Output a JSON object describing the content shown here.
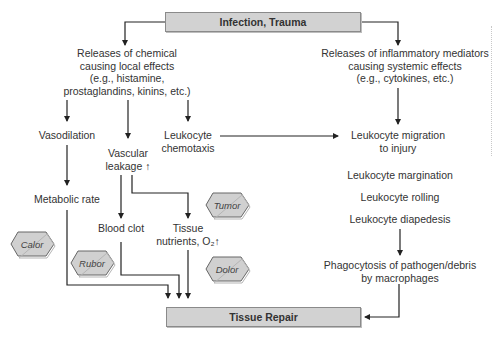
{
  "title_box": {
    "label": "Infection, Trauma"
  },
  "bottom_box": {
    "label": "Tissue Repair"
  },
  "local_branch": {
    "release": [
      "Releases of chemical",
      "causing local effects",
      "(e.g., histamine,",
      "prostaglandins, kinins, etc.)"
    ],
    "vasodilation": "Vasodilation",
    "vascular_leakage": [
      "Vascular",
      "leakage ↑"
    ],
    "leukocyte_chemotaxis": [
      "Leukocyte",
      "chemotaxis"
    ],
    "metabolic_rate": "Metabolic rate",
    "blood_clot": "Blood clot",
    "tissue_nutrients": [
      "Tissue",
      "nutrients, O₂↑"
    ]
  },
  "systemic_branch": {
    "release": [
      "Releases of inflammatory mediators",
      "causing systemic effects",
      "(e.g., cytokines, etc.)"
    ],
    "migration": [
      "Leukocyte migration",
      "to injury"
    ],
    "margination": "Leukocyte margination",
    "rolling": "Leukocyte rolling",
    "diapedesis": "Leukocyte diapedesis",
    "phagocytosis": [
      "Phagocytosis of pathogen/debris",
      "by macrophages"
    ]
  },
  "cardinal_signs": {
    "calor": "Calor",
    "rubor": "Rubor",
    "tumor": "Tumor",
    "dolor": "Dolor"
  },
  "colors": {
    "box_fill": "#d2d2d2",
    "box_border": "#8a8a8a",
    "line": "#222222",
    "text": "#333333"
  }
}
